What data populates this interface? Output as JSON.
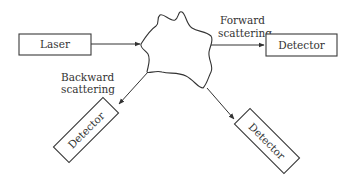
{
  "diagram": {
    "type": "light-scattering-setup",
    "nodes": {
      "laser": {
        "label": "Laser"
      },
      "sample": {
        "label": ""
      },
      "detector_forward": {
        "label": "Detector"
      },
      "detector_backward": {
        "label": "Detector"
      },
      "detector_side": {
        "label": "Detector"
      }
    },
    "annotations": {
      "forward_line1": "Forward",
      "forward_line2": "scattering",
      "backward_line1": "Backward",
      "backward_line2": "scattering"
    },
    "edges": [
      {
        "from": "laser",
        "to": "sample"
      },
      {
        "from": "sample",
        "to": "detector_forward",
        "label": "Forward scattering"
      },
      {
        "from": "sample",
        "to": "detector_backward",
        "label": "Backward scattering"
      },
      {
        "from": "sample",
        "to": "detector_side"
      }
    ],
    "colors": {
      "stroke": "#333333",
      "background": "#ffffff"
    }
  }
}
